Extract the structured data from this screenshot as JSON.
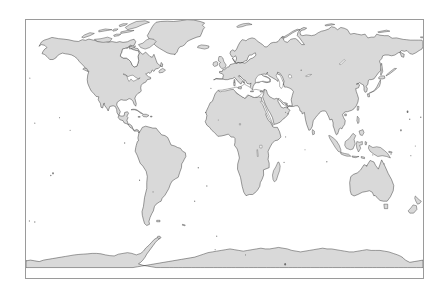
{
  "figure": {
    "type": "world-map",
    "projection": "equirectangular",
    "title": "",
    "background_color": "#ffffff",
    "frame": {
      "border_color": "#9a9a9a",
      "border_width_px": 1,
      "x_px": 25,
      "y_px": 19,
      "width_px": 399,
      "height_px": 260
    },
    "land": {
      "fill_color": "#d9d9d9",
      "outline_color": "#2b2b2b",
      "outline_width_px": 0.45
    },
    "ocean": {
      "fill_color": "#ffffff"
    },
    "extent": {
      "lon_min": -180,
      "lon_max": 180,
      "lat_min": -90,
      "lat_max": 83
    },
    "graticule_visible": false,
    "axis_labels_visible": false,
    "legend_visible": false,
    "landmasses": [
      "North America",
      "Greenland",
      "Canadian Arctic Archipelago",
      "South America",
      "Africa",
      "Europe",
      "Asia",
      "Australia",
      "New Guinea",
      "New Zealand",
      "Japan",
      "Philippines",
      "Indonesia",
      "Madagascar",
      "Iceland",
      "British Isles",
      "Sri Lanka",
      "Antarctica"
    ],
    "inland_waters": [
      "Hudson Bay",
      "Great Lakes",
      "Gulf of Mexico",
      "Mediterranean Sea",
      "Black Sea",
      "Caspian Sea",
      "Red Sea",
      "Persian Gulf",
      "Baltic Sea",
      "Lake Victoria",
      "Lake Baikal"
    ]
  }
}
